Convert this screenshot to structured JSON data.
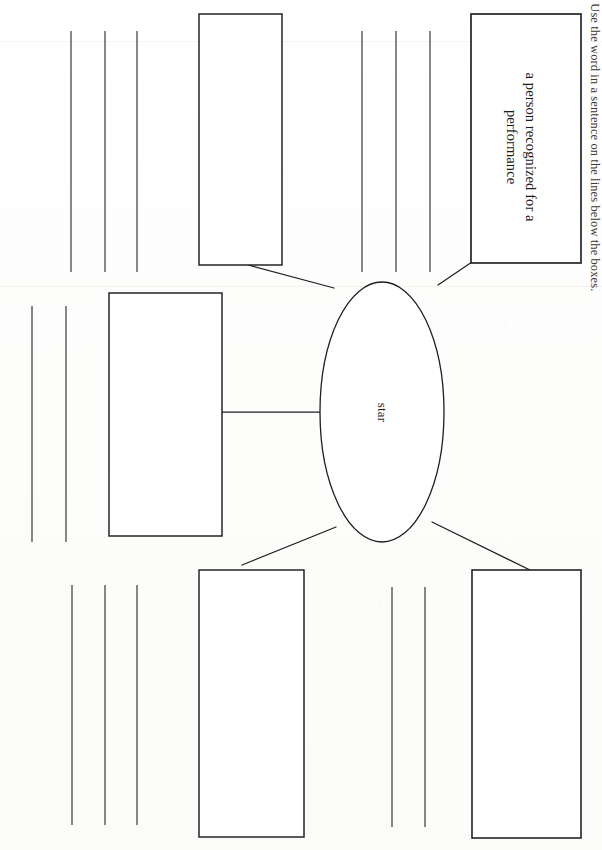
{
  "worksheet": {
    "instruction": "Use the word in a sentence on the lines below the boxes.",
    "center_word": "star",
    "orientation_degrees": 90
  },
  "diagram": {
    "type": "word-web",
    "center": {
      "shape": "ellipse",
      "label": "star"
    },
    "boxes": [
      {
        "id": "box-definition",
        "label": "a person recognized for a performance",
        "filled": true
      },
      {
        "id": "box-top-left",
        "label": "",
        "filled": false
      },
      {
        "id": "box-left",
        "label": "",
        "filled": false
      },
      {
        "id": "box-bottom-left",
        "label": "",
        "filled": false
      },
      {
        "id": "box-bottom-right",
        "label": "",
        "filled": false
      }
    ],
    "connector_count": 5
  },
  "writing_lines": {
    "groups": [
      {
        "id": "lines-top-left",
        "count": 3
      },
      {
        "id": "lines-top-right",
        "count": 3
      },
      {
        "id": "lines-mid-left",
        "count": 2
      },
      {
        "id": "lines-bottom-left",
        "count": 3
      },
      {
        "id": "lines-bottom-right",
        "count": 2
      }
    ],
    "total": 13
  },
  "colors": {
    "ink": "#1b1b1b",
    "rule": "#3a3a3a",
    "paper": "#fdfdfc"
  }
}
